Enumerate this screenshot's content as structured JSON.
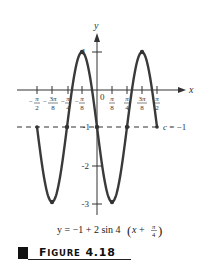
{
  "chart_data": {
    "type": "line",
    "title": "",
    "equation": "y = -1 + 2 sin 4(x + π/4)",
    "xlabel": "x",
    "ylabel": "y",
    "origin_label": "0",
    "x_tick_labels": [
      "-π/2",
      "-3π/8",
      "-π/4",
      "-π/8",
      "π/8",
      "π/4",
      "3π/8",
      "π/2"
    ],
    "x_tick_values": [
      -1.5708,
      -1.1781,
      -0.7854,
      -0.3927,
      0.3927,
      0.7854,
      1.1781,
      1.5708
    ],
    "y_tick_labels": [
      "1",
      "-1",
      "-2",
      "-3"
    ],
    "y_tick_values": [
      1,
      -1,
      -2,
      -3
    ],
    "series": [
      {
        "name": "y = -1 + 2 sin 4(x + π/4)",
        "x": [
          -1.5708,
          -1.1781,
          -0.7854,
          -0.3927,
          0,
          0.3927,
          0.7854,
          1.1781,
          1.5708
        ],
        "y": [
          -1,
          -3,
          -1,
          1,
          -1,
          -3,
          -1,
          1,
          -1
        ]
      }
    ],
    "reference_line": {
      "label": "c = -1",
      "y": -1,
      "style": "dashed"
    },
    "marked_points": [
      {
        "x": -0.7854,
        "y": -1
      },
      {
        "x": 0,
        "y": -1
      },
      {
        "x": 0.7854,
        "y": -1
      },
      {
        "x": -0.3927,
        "y": 1
      },
      {
        "x": 1.1781,
        "y": 1
      },
      {
        "x": -1.1781,
        "y": -3
      },
      {
        "x": 0.3927,
        "y": -3
      }
    ],
    "xlim": [
      -1.9,
      1.75
    ],
    "ylim": [
      -3.3,
      1.9
    ],
    "grid": false,
    "legend": "none"
  },
  "figure": {
    "caption_first": "F",
    "caption_rest": "IGURE",
    "caption_number": "4.18"
  }
}
